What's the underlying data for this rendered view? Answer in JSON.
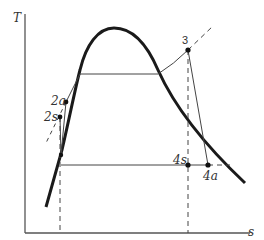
{
  "diagram": {
    "axes": {
      "y_label": "T",
      "x_label": "s"
    },
    "points": [
      {
        "id": "1",
        "label": "",
        "x": 61,
        "y": 155
      },
      {
        "id": "2s",
        "label": "2s",
        "x": 60,
        "y": 117
      },
      {
        "id": "2a",
        "label": "2a",
        "x": 66,
        "y": 102
      },
      {
        "id": "3",
        "label": "3",
        "x": 188,
        "y": 50
      },
      {
        "id": "4s",
        "label": "4s",
        "x": 188,
        "y": 165
      },
      {
        "id": "4a",
        "label": "4a",
        "x": 208,
        "y": 165
      }
    ],
    "colors": {
      "line": "#2b2b2b",
      "dome": "#1a1a1a",
      "background": "#ffffff"
    }
  }
}
